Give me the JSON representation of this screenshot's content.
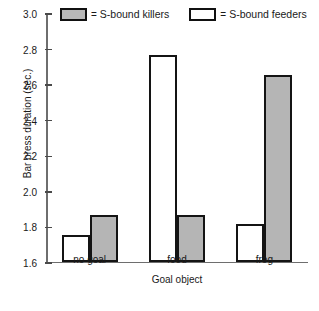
{
  "chart_data": {
    "type": "bar",
    "title": "",
    "xlabel": "Goal object",
    "ylabel": "Bar press duration (sec.)",
    "categories": [
      "no goal",
      "food",
      "frog"
    ],
    "series": [
      {
        "name": "S-bound feeders",
        "values": [
          1.75,
          2.76,
          1.81
        ],
        "color": "#ffffff"
      },
      {
        "name": "S-bound killers",
        "values": [
          1.86,
          1.86,
          2.65
        ],
        "color": "#b5b5b5"
      }
    ],
    "ylim": [
      1.6,
      3.0
    ],
    "yticks": [
      1.6,
      1.8,
      2.0,
      2.2,
      2.4,
      2.6,
      2.8,
      3.0
    ],
    "ytick_labels": [
      "1.6",
      "1.8",
      "2.0",
      "2.2",
      "2.4",
      "2.6",
      "2.8",
      "3.0"
    ],
    "grid": false,
    "legend_position": "top",
    "legend": [
      {
        "label": "S-bound killers",
        "equals": "=",
        "swatch": "filled"
      },
      {
        "label": "S-bound feeders",
        "equals": "=",
        "swatch": "empty"
      }
    ]
  }
}
